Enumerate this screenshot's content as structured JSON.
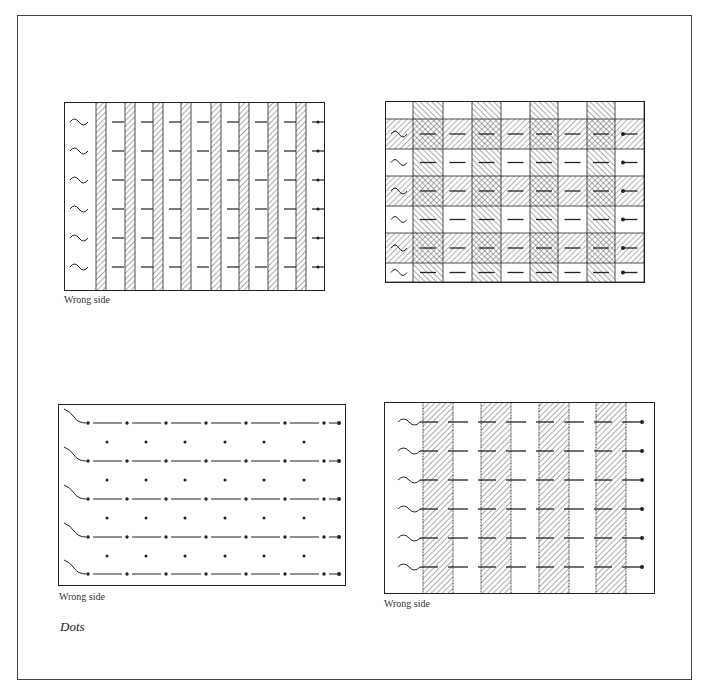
{
  "figures": [
    {
      "id": "fig1",
      "caption": "Wrong side",
      "rows": 6,
      "stripes": 10,
      "pattern": "vertical-stripes-narrow"
    },
    {
      "id": "fig2",
      "caption": "",
      "rows": 7,
      "cols": 9,
      "pattern": "plaid-check"
    },
    {
      "id": "fig3",
      "caption": "Wrong side",
      "rows": 5,
      "dots_per_row": 7,
      "pattern": "dots"
    },
    {
      "id": "fig4",
      "caption": "Wrong side",
      "rows": 6,
      "stripes": 4,
      "pattern": "vertical-stripes-wide"
    }
  ],
  "section_title": "Dots",
  "colors": {
    "line": "#222222",
    "hatch": "#555555",
    "paper": "#ffffff",
    "frame": "#444444"
  }
}
